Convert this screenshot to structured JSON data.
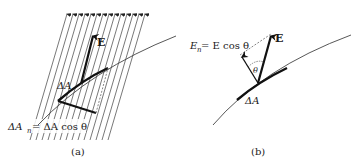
{
  "figure": {
    "panel_a": {
      "caption": "(a)",
      "field_label": "E",
      "area_label": "ΔA",
      "projection_label": "ΔA",
      "projection_subscript": "n",
      "projection_eq": " = ΔA cos θ",
      "field_line_count": 14
    },
    "panel_b": {
      "caption": "(b)",
      "field_label": "E",
      "area_label": "ΔA",
      "normal_label": "E",
      "normal_subscript": "n",
      "normal_eq": " = E cos θ",
      "angle_label": "θ"
    },
    "colors": {
      "ink": "#1a1a1a",
      "field_line": "#555555",
      "curve": "#444444"
    }
  }
}
